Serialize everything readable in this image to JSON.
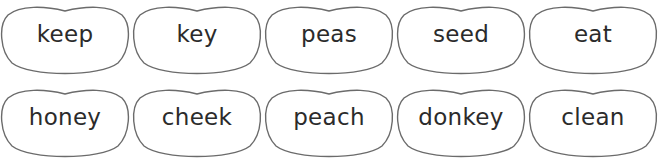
{
  "worksheet": {
    "rows": [
      {
        "beans": [
          {
            "word": "keep"
          },
          {
            "word": "key"
          },
          {
            "word": "peas"
          },
          {
            "word": "seed"
          },
          {
            "word": "eat"
          }
        ]
      },
      {
        "beans": [
          {
            "word": "honey"
          },
          {
            "word": "cheek"
          },
          {
            "word": "peach"
          },
          {
            "word": "donkey"
          },
          {
            "word": "clean"
          }
        ]
      }
    ],
    "colors": {
      "outline": "#6b6b6b",
      "text": "#2b2b2b",
      "background": "#ffffff"
    }
  }
}
